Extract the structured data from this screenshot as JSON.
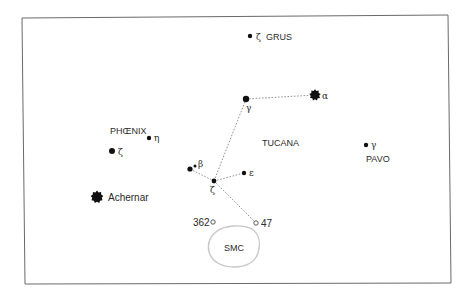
{
  "chart_data": {
    "type": "diagram",
    "frame": {
      "x": 22,
      "y": 17,
      "w": 428,
      "h": 267
    },
    "constellation_labels": [
      {
        "id": "grus",
        "text": "GRUS",
        "x": 266,
        "y": 40
      },
      {
        "id": "phoenix",
        "text": "PHŒNIX",
        "x": 110,
        "y": 134
      },
      {
        "id": "tucana",
        "text": "TUCANA",
        "x": 262,
        "y": 146
      },
      {
        "id": "pavo",
        "text": "PAVO",
        "x": 366,
        "y": 162
      }
    ],
    "stars": [
      {
        "id": "zeta-gru",
        "greek": "ζ",
        "x": 250,
        "y": 36,
        "r": 2.2,
        "lx": 256,
        "ly": 40
      },
      {
        "id": "gamma-tuc",
        "greek": "γ",
        "x": 246,
        "y": 99,
        "r": 3.2,
        "lx": 246,
        "ly": 111
      },
      {
        "id": "alpha-tuc",
        "greek": "α",
        "x": 315,
        "y": 95,
        "r": 4.2,
        "lx": 322,
        "ly": 99,
        "bright": true
      },
      {
        "id": "eta-phe",
        "greek": "η",
        "x": 149,
        "y": 138,
        "r": 2.2,
        "lx": 154,
        "ly": 141
      },
      {
        "id": "zeta-phe",
        "greek": "ζ",
        "x": 112,
        "y": 151,
        "r": 3.0,
        "lx": 118,
        "ly": 155
      },
      {
        "id": "gamma-pav",
        "greek": "γ",
        "x": 366,
        "y": 145,
        "r": 2.2,
        "lx": 371,
        "ly": 148
      },
      {
        "id": "beta1-tuc",
        "greek": "β",
        "x": 190,
        "y": 169,
        "r": 2.6,
        "lx": 198,
        "ly": 167
      },
      {
        "id": "beta2-tuc",
        "greek": "",
        "x": 195,
        "y": 166,
        "r": 1.5,
        "lx": 0,
        "ly": 0
      },
      {
        "id": "zeta-tuc",
        "greek": "ζ",
        "x": 214,
        "y": 181,
        "r": 2.4,
        "lx": 210,
        "ly": 193
      },
      {
        "id": "epsilon-tuc",
        "greek": "ε",
        "x": 244,
        "y": 173,
        "r": 2.2,
        "lx": 249,
        "ly": 176
      },
      {
        "id": "achernar",
        "greek": "",
        "x": 97,
        "y": 197,
        "r": 4.8,
        "lx": 0,
        "ly": 0,
        "bright": true
      }
    ],
    "named_stars": [
      {
        "id": "achernar",
        "text": "Achernar",
        "x": 108,
        "y": 201
      }
    ],
    "lines": [
      {
        "from": "gamma-tuc",
        "to": "alpha-tuc"
      },
      {
        "from": "gamma-tuc",
        "to": "zeta-tuc"
      },
      {
        "from": "beta1-tuc",
        "to": "zeta-tuc"
      },
      {
        "from": "zeta-tuc",
        "to": "epsilon-tuc"
      },
      {
        "from": "zeta-tuc",
        "to": "ngc104"
      }
    ],
    "deep_sky": [
      {
        "id": "ngc362",
        "text": "362",
        "x": 213,
        "y": 222,
        "lx": 193,
        "ly": 226,
        "anchor": "start"
      },
      {
        "id": "ngc104",
        "text": "47",
        "x": 256,
        "y": 223,
        "lx": 261,
        "ly": 227,
        "anchor": "start"
      }
    ],
    "smc": {
      "text": "SMC",
      "cx": 234,
      "cy": 247,
      "label_x": 234,
      "label_y": 250
    }
  },
  "colors": {
    "ink": "#111111",
    "line": "#888888",
    "frame": "#6a6a6a",
    "smc": "#c8c8c8"
  }
}
